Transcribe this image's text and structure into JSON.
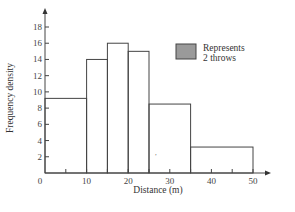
{
  "chart_data": {
    "type": "bar",
    "subtype": "histogram",
    "title": "",
    "xlabel": "Distance (m)",
    "ylabel": "Frequency density",
    "xlim": [
      0,
      50
    ],
    "ylim": [
      0,
      18
    ],
    "x_ticks": [
      0,
      10,
      20,
      30,
      40,
      50
    ],
    "y_ticks": [
      2,
      4,
      6,
      8,
      10,
      12,
      14,
      16,
      18
    ],
    "bins": [
      {
        "from": 0,
        "to": 10,
        "frequency_density": 9.2
      },
      {
        "from": 10,
        "to": 15,
        "frequency_density": 14
      },
      {
        "from": 15,
        "to": 20,
        "frequency_density": 16
      },
      {
        "from": 20,
        "to": 25,
        "frequency_density": 15
      },
      {
        "from": 25,
        "to": 35,
        "frequency_density": 8.5
      },
      {
        "from": 35,
        "to": 50,
        "frequency_density": 3.2
      }
    ],
    "categories": [
      "0-10",
      "10-15",
      "15-20",
      "20-25",
      "25-35",
      "35-50"
    ],
    "values": [
      9.2,
      14,
      16,
      15,
      8.5,
      3.2
    ],
    "grid": false,
    "legend": {
      "position": "upper right",
      "swatch_color": "#9a9a9a",
      "line1": "Represents",
      "line2": "2 throws"
    }
  },
  "labels": {
    "origin": "0"
  }
}
